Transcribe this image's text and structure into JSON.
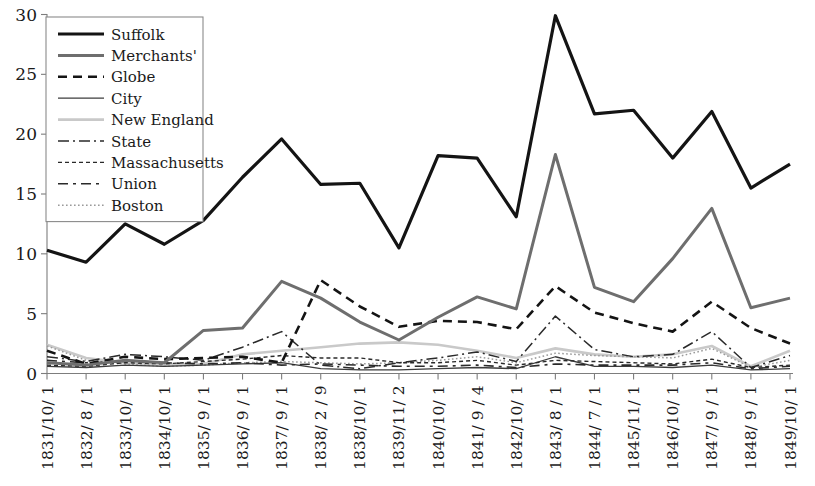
{
  "chart_data": {
    "type": "line",
    "title": "",
    "xlabel": "",
    "ylabel": "",
    "ylim": [
      0,
      30
    ],
    "yticks": [
      0,
      5,
      10,
      15,
      20,
      25,
      30
    ],
    "grid": false,
    "legend_position": "top-left",
    "x_rotated": true,
    "categories": [
      "1831/10/ 1",
      "1832/ 8 / 1",
      "1833/10/ 1",
      "1834/10/ 1",
      "1835/ 9 / 1",
      "1836/ 9 / 1",
      "1837/ 9 / 1",
      "1838/ 2 / 9",
      "1838/10/ 1",
      "1839/11/ 2",
      "1840/10/ 1",
      "1841/ 9 / 4",
      "1842/10/ 1",
      "1843/ 8 / 1",
      "1844/ 7 / 1",
      "1845/11/ 1",
      "1846/10/ 1",
      "1847/ 9 / 1",
      "1848/ 9 / 1",
      "1849/10/ 1"
    ],
    "series": [
      {
        "name": "Suffolk",
        "style": "solid",
        "color": "#141414",
        "width": 3.2,
        "dash": "none",
        "values": [
          10.3,
          9.3,
          12.5,
          10.8,
          12.8,
          16.4,
          19.6,
          15.8,
          15.9,
          10.5,
          18.2,
          18.0,
          13.1,
          29.9,
          21.7,
          22.0,
          18.0,
          21.9,
          15.5,
          17.5
        ]
      },
      {
        "name": "Merchants'",
        "style": "solid",
        "color": "#6e6e6e",
        "width": 3.0,
        "dash": "none",
        "values": [
          0.9,
          0.7,
          1.1,
          0.9,
          3.6,
          3.8,
          7.7,
          6.3,
          4.3,
          2.8,
          4.7,
          6.4,
          5.4,
          18.3,
          7.2,
          6.0,
          9.6,
          13.8,
          5.5,
          6.3
        ]
      },
      {
        "name": "Globe",
        "style": "dashed",
        "color": "#141414",
        "width": 2.6,
        "dash": "9,6",
        "values": [
          1.9,
          0.8,
          1.4,
          1.2,
          1.3,
          1.4,
          0.9,
          7.8,
          5.6,
          3.9,
          4.4,
          4.3,
          3.7,
          7.3,
          5.1,
          4.2,
          3.5,
          6.0,
          3.8,
          2.5
        ]
      },
      {
        "name": "City",
        "style": "solid",
        "color": "#3c3c3c",
        "width": 1.3,
        "dash": "none",
        "values": [
          0.6,
          0.5,
          0.7,
          0.6,
          0.7,
          0.8,
          0.9,
          0.4,
          0.3,
          0.3,
          0.4,
          0.5,
          0.4,
          1.4,
          0.6,
          0.6,
          0.5,
          0.7,
          0.3,
          0.4
        ]
      },
      {
        "name": "New England",
        "style": "solid",
        "color": "#c9c9c9",
        "width": 2.6,
        "dash": "none",
        "values": [
          2.4,
          1.3,
          0.9,
          0.7,
          0.8,
          1.6,
          1.9,
          2.2,
          2.5,
          2.6,
          2.4,
          1.9,
          1.3,
          2.1,
          1.6,
          1.4,
          1.6,
          2.3,
          0.6,
          1.9
        ]
      },
      {
        "name": "State",
        "style": "dashdot",
        "color": "#2a2a2a",
        "width": 1.5,
        "dash": "11,4,2,4",
        "values": [
          1.4,
          1.0,
          1.6,
          1.4,
          1.1,
          2.2,
          3.5,
          0.7,
          0.4,
          0.9,
          1.3,
          1.8,
          1.0,
          4.8,
          2.0,
          1.4,
          1.6,
          3.5,
          0.5,
          1.5
        ]
      },
      {
        "name": "Massachusetts",
        "style": "dotted-dash",
        "color": "#2a2a2a",
        "width": 1.4,
        "dash": "4,3",
        "values": [
          0.7,
          0.6,
          0.9,
          0.8,
          1.0,
          1.2,
          1.5,
          1.3,
          1.3,
          0.9,
          0.9,
          1.1,
          0.7,
          1.1,
          1.0,
          0.9,
          0.8,
          1.2,
          0.5,
          0.7
        ]
      },
      {
        "name": "Union",
        "style": "longdash",
        "color": "#2a2a2a",
        "width": 1.6,
        "dash": "10,5,3,5",
        "values": [
          1.1,
          0.9,
          1.0,
          0.9,
          0.8,
          0.9,
          0.7,
          0.8,
          0.7,
          0.6,
          0.6,
          0.7,
          0.5,
          0.8,
          0.7,
          0.7,
          0.7,
          0.9,
          0.4,
          0.6
        ]
      },
      {
        "name": "Boston",
        "style": "dotted",
        "color": "#9a9a9a",
        "width": 1.5,
        "dash": "1.6,2.4",
        "values": [
          2.3,
          1.1,
          0.8,
          0.6,
          0.7,
          0.9,
          1.0,
          0.9,
          0.8,
          0.9,
          1.1,
          1.4,
          0.9,
          1.7,
          1.5,
          1.4,
          1.3,
          2.1,
          0.5,
          1.1
        ]
      }
    ]
  },
  "legend": {
    "items": [
      {
        "label": "Suffolk"
      },
      {
        "label": "Merchants'"
      },
      {
        "label": "Globe"
      },
      {
        "label": "City"
      },
      {
        "label": "New England"
      },
      {
        "label": "State"
      },
      {
        "label": "Massachusetts"
      },
      {
        "label": "Union"
      },
      {
        "label": "Boston"
      }
    ]
  },
  "axes": {
    "y_tick_labels": [
      "0",
      "5",
      "10",
      "15",
      "20",
      "25",
      "30"
    ]
  }
}
